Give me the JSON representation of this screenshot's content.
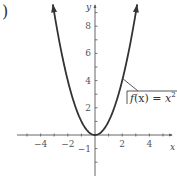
{
  "figure": {
    "part_marker": ")",
    "function_label": {
      "prefix": "f",
      "arg": "(x) = ",
      "var": "x",
      "exp": "2"
    },
    "axes": {
      "x_name": "x",
      "y_name": "y"
    },
    "colors": {
      "curve": "#333333",
      "axis": "#555555",
      "text": "#555555"
    }
  },
  "chart_data": {
    "type": "line",
    "xlabel": "x",
    "ylabel": "y",
    "xlim": [
      -5.5,
      5.7
    ],
    "ylim": [
      -3,
      9.8
    ],
    "x_ticks": [
      -4,
      -2,
      2,
      4
    ],
    "x_tick_labels": [
      "-4",
      "-2",
      "2",
      "4"
    ],
    "y_ticks": [
      -1,
      2,
      4,
      6,
      8
    ],
    "y_tick_labels": [
      "-1",
      "2",
      "4",
      "6",
      "8"
    ],
    "grid": false,
    "legend": "none",
    "annotations": [
      {
        "text": "f(x) = x^2",
        "points_to": [
          2.03,
          4.1
        ]
      }
    ],
    "series": [
      {
        "name": "f(x) = x^2",
        "x": [
          -3.1,
          -3,
          -2.5,
          -2,
          -1.5,
          -1,
          -0.5,
          0,
          0.5,
          1,
          1.5,
          2,
          2.5,
          3,
          3.1
        ],
        "y": [
          9.61,
          9,
          6.25,
          4,
          2.25,
          1,
          0.25,
          0,
          0.25,
          1,
          2.25,
          4,
          6.25,
          9,
          9.61
        ],
        "arrows_at_ends": true
      }
    ]
  }
}
